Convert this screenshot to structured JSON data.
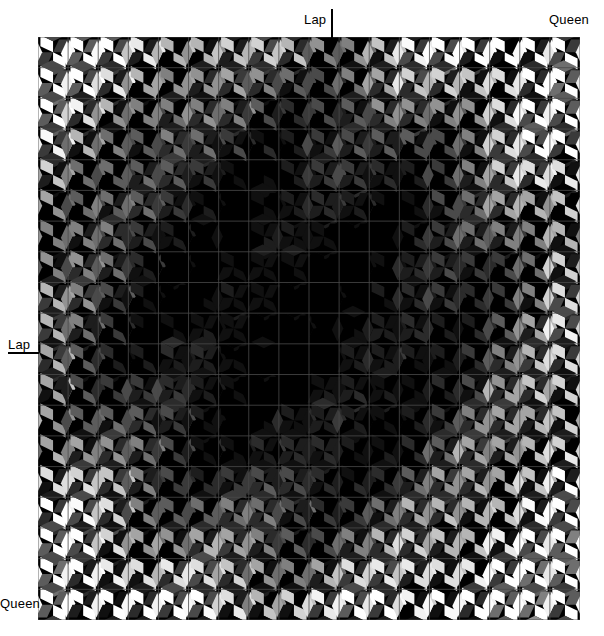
{
  "figure": {
    "type": "tiling-diagram",
    "background_color": "#ffffff",
    "labels": {
      "lap_top": "Lap",
      "lap_left": "Lap",
      "queen_top_right": "Queen",
      "queen_bottom_left": "Queen"
    }
  },
  "tiling": {
    "name": "pinwheel-quadrilateral-tiling",
    "origin_x": 38,
    "origin_y": 37,
    "width": 542,
    "height": 583,
    "cols": 18,
    "rows": 19,
    "cell_w": 30.11,
    "cell_h": 30.68,
    "grid_line_color": "#4a4a4a",
    "grid_line_width": 0.8,
    "background_color": "#000000",
    "pieces_per_cell": 4,
    "shade_palette": [
      "#000000",
      "#101010",
      "#1d1d1d",
      "#2b2b2b",
      "#3a3a3a",
      "#4a4a4a",
      "#5c5c5c",
      "#6e6e6e",
      "#808080",
      "#929292",
      "#a4a4a4",
      "#b5b5b5",
      "#c4c4c4",
      "#d2d2d2",
      "#dedede",
      "#e9e9e9",
      "#f2f2f2",
      "#fafafa",
      "#ffffff"
    ],
    "shading_rule": "radial-falloff-bright-at-border-dark-at-center",
    "center_col": 8.5,
    "center_row": 9.0
  },
  "markers": {
    "lap_top_tick": {
      "x": 331,
      "y": 9,
      "w": 2,
      "h": 29,
      "color": "#000000"
    },
    "lap_left_tick": {
      "x": 8,
      "y": 352,
      "w": 31,
      "h": 2,
      "color": "#000000"
    }
  }
}
